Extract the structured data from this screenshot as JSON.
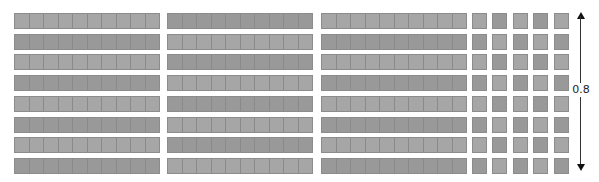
{
  "diagram": {
    "strip_groups": 3,
    "rows": 8,
    "cells_per_strip": 10,
    "unit_columns": 5,
    "colors": {
      "shade_a": "#a6a6a6",
      "shade_b": "#999999",
      "border": "#8c8c8c"
    },
    "row_shades": [
      "a",
      "b",
      "a",
      "b",
      "a",
      "b",
      "a",
      "b"
    ],
    "unit_shades": [
      [
        "a",
        "b",
        "a",
        "b",
        "a"
      ],
      [
        "b",
        "a",
        "b",
        "a",
        "b"
      ],
      [
        "a",
        "b",
        "a",
        "b",
        "a"
      ],
      [
        "b",
        "a",
        "b",
        "a",
        "b"
      ],
      [
        "a",
        "b",
        "a",
        "b",
        "a"
      ],
      [
        "b",
        "a",
        "b",
        "a",
        "b"
      ],
      [
        "a",
        "b",
        "a",
        "b",
        "a"
      ],
      [
        "b",
        "a",
        "b",
        "a",
        "b"
      ]
    ]
  },
  "measure": {
    "label": "0.8",
    "arrow": "double-headed vertical"
  }
}
